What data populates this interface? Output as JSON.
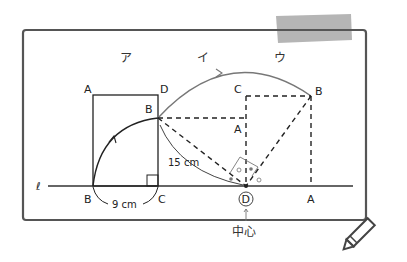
{
  "figure": {
    "headers": [
      "ア",
      "イ",
      "ウ"
    ],
    "line_label": "ℓ",
    "square_left": {
      "A": "A",
      "D": "D",
      "B_bottom": "B",
      "C": "C",
      "B_moved": "B"
    },
    "square_right": {
      "C": "C",
      "B": "B",
      "A_mid": "A",
      "A_bottom": "A"
    },
    "center_label": "D",
    "center_caption": "中心",
    "measure_bc": "9 cm",
    "measure_radius": "15 cm"
  },
  "colors": {
    "frame": "#555555",
    "ink": "#222222",
    "arc": "#777777",
    "tape": "#9a9a9a"
  }
}
